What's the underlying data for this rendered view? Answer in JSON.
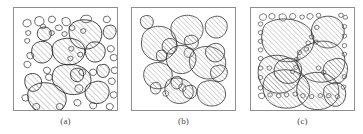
{
  "figure": {
    "panel_count": 3,
    "background_color": "#ffffff",
    "frame_color": "#8e8e8e",
    "grain_outline_color": "#2b2b2b",
    "hatch_color": "#7a7a7a",
    "label_color": "#4a4a4a"
  },
  "panels": [
    {
      "id": "panel-a",
      "label": "(a)",
      "description": "Many small voids and few scattered medium hatched grains in a matrix",
      "frame": {
        "x": 13,
        "y": 7,
        "width": 105,
        "height": 104
      },
      "hatched_grain_count": 12,
      "void_count": 46
    },
    {
      "id": "panel-b",
      "label": "(b)",
      "description": "Uniform medium-to-large hatched grains with moderate spacing",
      "frame": {
        "x": 131,
        "y": 7,
        "width": 105,
        "height": 104
      },
      "hatched_grain_count": 17,
      "void_count": 3
    },
    {
      "id": "panel-c",
      "label": "(c)",
      "description": "Large interlocking hatched grains with small voids along the boundaries",
      "frame": {
        "x": 250,
        "y": 7,
        "width": 105,
        "height": 104
      },
      "hatched_grain_count": 9,
      "void_count": 52
    }
  ],
  "shapes": {
    "panel_a": {
      "grains": [
        "M 62,14 C 70,10 84,12 88,20 C 92,28 88,38 79,41 C 69,44 59,39 57,30 C 55,22 56,17 62,14 Z",
        "M 22,36 C 28,32 37,34 39,41 C 41,48 37,55 30,56 C 23,57 18,51 18,45 C 18,40 19,38 22,36 Z",
        "M 45,33 C 56,28 70,32 72,41 C 74,51 65,59 54,58 C 44,57 38,49 39,41 C 40,36 41,35 45,33 Z",
        "M 79,35 C 86,33 93,37 93,44 C 93,51 88,56 81,55 C 75,54 72,48 73,42 C 74,38 76,36 79,35 Z",
        "M 44,60 C 57,54 75,59 78,70 C 81,81 70,90 57,88 C 45,86 38,77 39,69 C 40,64 41,62 44,60 Z",
        "M 14,68 C 20,65 27,68 28,74 C 29,80 25,85 19,85 C 14,85 11,80 11,75 C 11,71 12,69 14,68 Z",
        "M 20,79 C 33,72 51,79 53,91 C 55,102 43,110 30,107 C 19,105 13,96 14,87 C 15,82 17,81 20,79 Z",
        "M 80,76 C 88,72 97,77 97,85 C 97,94 89,99 81,97 C 74,95 71,88 73,82 C 74,78 77,77 80,76 Z",
        "M 28,20 C 33,18 38,21 38,26 C 38,31 34,34 29,33 C 25,32 23,28 24,24 C 25,21 26,20 28,20 Z",
        "M 96,18 C 101,16 105,20 104,25 C 103,30 99,33 95,31 C 91,29 90,24 92,21 C 93,19 94,18 96,18 Z",
        "M 62,62 C 67,60 71,63 71,68 C 71,73 67,76 63,75 C 58,74 57,69 58,65 C 59,63 60,62 62,62 Z",
        "M 89,58 C 94,56 98,60 97,65 C 96,70 92,72 88,70 C 84,68 84,63 85,60 C 86,58 87,58 89,58 Z"
      ],
      "voids": [
        "M 10,13 q 4,-3 7,0 q 2,4 -2,6 q -5,1 -6,-3 z",
        "M 22,10 q 5,-3 8,1 q 2,5 -3,7 q -5,1 -6,-4 z",
        "M 36,9 q 4,-2 6,1 q 1,4 -3,5 q -4,0 -4,-3 z",
        "M 49,11 q 5,-3 8,1 q 2,4 -2,6 q -5,1 -6,-4 z",
        "M 70,8 q 7,-2 9,2 q 1,4 -5,5 q -6,0 -6,-4 z",
        "M 92,9 q 4,-2 6,1 q 1,4 -3,5 q -4,0 -4,-3 z",
        "M 28,17 q 3,-2 4,1 q 1,3 -2,3 q -3,0 -3,-2 z",
        "M 43,18 q 4,-2 6,1 q 1,4 -3,4 q -4,0 -4,-3 z",
        "M 57,18 q 3,-2 5,1 q 1,3 -2,4 q -4,0 -4,-3 z",
        "M 12,24 q 3,-2 5,0 q 1,3 -2,4 q -3,0 -3,-2 z",
        "M 36,24 q 3,-2 5,0 q 1,3 -2,4 q -3,0 -3,-2 z",
        "M 49,25 q 3,-2 5,0 q 1,3 -2,4 q -3,0 -3,-2 z",
        "M 68,22 q 3,-2 5,0 q 1,3 -2,4 q -3,0 -3,-2 z",
        "M 11,32 q 3,-2 5,0 q 1,3 -2,4 q -3,0 -3,-2 z",
        "M 44,45 q 0,0 0,0 z",
        "M 56,40 q 3,-2 5,0 q 1,3 -2,4 q -3,0 -3,-2 z",
        "M 65,46 q 3,-2 5,0 q 1,3 -2,4 q -3,0 -3,-2 z",
        "M 14,46 q 4,-2 6,1 q 1,4 -3,5 q -4,0 -4,-4 z",
        "M 11,55 q 4,-2 6,1 q 1,4 -3,5 q -4,0 -4,-4 z",
        "M 31,61 q 4,-2 6,1 q 1,4 -3,5 q -4,0 -4,-4 z",
        "M 44,52 q 0,0 0,0 z",
        "M 55,50 q 3,-2 5,0 q 1,3 -2,4 q -3,0 -3,-2 z",
        "M 83,44 q 0,0 0,0 z",
        "M 96,39 q 4,-2 6,1 q 1,4 -3,5 q -4,0 -4,-4 z",
        "M 99,48 q 4,-2 6,1 q 1,4 -3,5 q -4,0 -4,-4 z",
        "M 66,54 q 0,0 0,0 z",
        "M 40,72 q 0,0 0,0 z",
        "M 57,68 q 0,0 0,0 z",
        "M 67,63 q 4,-2 6,1 q 1,4 -3,5 q -4,0 -4,-4 z",
        "M 78,63 q 4,-2 6,1 q 1,4 -3,5 q -4,0 -4,-4 z",
        "M 100,61 q 4,-2 6,1 q 1,4 -3,5 q -4,0 -4,-4 z",
        "M 33,68 q 4,-2 6,1 q 1,4 -3,5 q -4,0 -4,-4 z",
        "M 58,74 q 0,0 0,0 z",
        "M 63,79 q 5,-2 7,1 q 1,5 -3,6 q -5,0 -5,-4 z",
        "M 88,69 q 0,0 0,0 z",
        "M 97,72 q 4,-2 6,1 q 1,4 -3,5 q -4,0 -4,-4 z",
        "M 9,89 q 4,-2 6,1 q 1,4 -3,5 q -4,0 -4,-4 z",
        "M 56,93 q 0,0 0,0 z",
        "M 62,94 q 4,-2 6,1 q 1,4 -3,5 q -4,0 -4,-4 z",
        "M 70,95 q 0,0 0,0 z",
        "M 91,89 q 0,0 0,0 z",
        "M 99,86 q 4,-2 6,1 q 1,4 -3,5 q -4,0 -4,-4 z",
        "M 20,98 q 4,-2 6,1 q 1,4 -3,5 q -4,0 -4,-4 z",
        "M 44,98 q 4,-2 6,1 q 1,4 -3,5 q -4,0 -4,-4 z",
        "M 78,97 q 4,-2 6,1 q 1,4 -3,5 q -4,0 -4,-4 z",
        "M 95,98 q 4,-2 6,1 q 1,4 -3,5 q -4,0 -4,-4 z"
      ]
    },
    "panel_b": {
      "grains": [
        "M 8,27 C 18,18 38,20 43,34 C 48,48 38,62 24,62 C 11,62 2,52 3,40 C 4,32 5,30 8,27 Z",
        "M 45,12 C 56,5 72,9 75,21 C 78,33 68,44 55,43 C 43,42 36,31 38,21 C 39,16 42,14 45,12 Z",
        "M 86,11 C 94,7 104,12 104,21 C 104,31 96,37 88,35 C 80,33 76,24 79,17 C 81,13 83,12 86,11 Z",
        "M 68,48 C 82,41 100,48 102,62 C 104,76 91,86 77,83 C 64,80 57,68 60,57 C 62,51 65,50 68,48 Z",
        "M 41,46 C 52,41 65,46 67,57 C 69,69 59,79 47,77 C 36,75 30,64 33,55 C 35,49 38,48 41,46 Z",
        "M 14,66 C 24,61 37,66 39,76 C 41,87 32,96 21,95 C 10,94 4,84 6,75 C 8,69 11,67 14,66 Z",
        "M 36,84 C 49,79 63,86 64,97 C 65,107 55,114 44,112 C 34,110 29,101 31,92 C 32,87 34,85 36,84 Z",
        "M 76,87 C 88,82 101,89 102,100 C 103,110 93,117 82,115 C 72,113 67,104 69,95 C 70,90 73,88 76,87 Z",
        "M 32,37 C 38,34 44,37 45,43 C 46,50 41,55 35,54 C 29,53 26,47 28,42 C 29,39 30,38 32,37 Z",
        "M 85,43 C 93,39 101,44 101,52 C 101,60 94,65 87,63 C 80,61 77,54 79,48 C 81,45 83,44 85,43 Z",
        "M 43,81 C 47,79 51,82 51,87 C 51,93 47,96 43,95 C 39,94 37,89 38,85 C 39,82 41,81 43,81 Z",
        "M 5,10 C 11,7 17,10 17,16 C 17,22 12,26 7,24 C 3,22 1,17 2,13 C 3,11 4,10 5,10 Z",
        "M 25,50 C 29,48 33,51 33,56 C 33,61 29,64 25,63 C 21,62 20,57 21,53 C 22,51 23,50 25,50 Z",
        "M 56,92 C 62,89 68,92 68,98 C 68,104 63,108 58,106 C 53,105 51,99 52,95 C 53,93 54,92 56,92 Z",
        "M 92,68 C 99,65 105,70 104,77 C 103,84 97,88 91,86 C 85,84 83,77 85,72 C 87,69 89,68 92,68 Z",
        "M 58,33 C 64,30 70,34 70,40 C 70,46 65,50 60,48 C 55,46 53,40 54,36 C 55,34 56,33 58,33 Z",
        "M 18,88 C 22,86 26,89 26,94 C 26,99 22,102 18,101 C 14,100 13,95 14,91 C 15,89 16,88 18,88 Z"
      ],
      "voids": [
        "M 55,48 q 6,-3 9,2 q 2,6 -4,8 q -6,1 -7,-5 z",
        "M 48,90 q 5,-2 7,2 q 1,5 -3,6 q -5,0 -5,-5 z",
        "M 29,98 q 4,-2 6,1 q 1,4 -3,5 q -4,0 -4,-4 z"
      ]
    },
    "panel_c": {
      "grains": [
        "M 14,17 C 30,8 60,13 66,31 C 72,49 54,64 33,62 C 15,60 5,45 7,31 C 8,23 10,19 14,17 Z",
        "M 73,12 C 85,6 100,11 102,24 C 104,38 93,48 80,46 C 68,44 62,33 65,22 C 67,16 70,13 73,12 Z",
        "M 62,42 C 80,33 102,41 103,60 C 104,78 86,89 68,85 C 52,81 44,65 49,53 C 52,46 57,44 62,42 Z",
        "M 10,58 C 26,50 48,57 51,73 C 54,89 38,101 21,98 C 7,95 1,82 3,70 C 5,62 7,60 10,58 Z",
        "M 18,75 C 37,66 60,75 62,92 C 64,109 46,119 28,115 C 13,112 6,98 9,86 C 11,79 14,77 18,75 Z",
        "M 58,77 C 75,70 95,78 96,95 C 97,111 81,120 65,117 C 51,114 45,101 48,89 C 50,82 54,79 58,77 Z",
        "M 88,60 C 98,55 107,61 106,72 C 105,84 96,90 87,87 C 79,84 76,74 79,67 C 81,62 85,61 88,60 Z",
        "M 86,88 C 95,83 104,89 104,99 C 104,110 96,116 88,113 C 80,110 77,100 79,93 C 81,89 83,89 86,88 Z",
        "M 30,60 C 40,55 52,60 53,70 C 54,81 45,89 34,87 C 24,85 19,76 22,68 C 24,63 27,61 30,60 Z"
      ],
      "voids": [
        "M 5,8 q 4,-3 7,0 q 2,4 -2,6 q -5,1 -6,-3 z",
        "M 16,7 q 4,-2 6,1 q 1,4 -3,5 q -4,0 -4,-3 z",
        "M 27,8 q 5,-3 8,1 q 2,4 -2,6 q -5,1 -6,-4 z",
        "M 40,7 q 4,-2 6,1 q 1,4 -3,5 q -4,0 -4,-3 z",
        "M 51,9 q 3,-2 5,0 q 1,3 -2,4 q -3,0 -3,-2 z",
        "M 60,7 q 4,-2 6,1 q 1,4 -3,5 q -4,0 -4,-3 z",
        "M 70,7 q 3,-2 5,0 q 1,3 -2,4 q -3,0 -3,-2 z",
        "M 96,7 q 3,-2 5,0 q 1,3 -2,4 q -3,0 -3,-2 z",
        "M 102,9 q 3,-2 4,1 q 1,3 -2,3 q -3,0 -3,-2 z",
        "M 3,17 q 3,-2 5,0 q 1,3 -2,4 q -3,0 -3,-2 z",
        "M 3,27 q 3,-2 5,0 q 1,3 -2,4 q -3,0 -3,-2 z",
        "M 3,37 q 3,-2 5,0 q 1,3 -2,4 q -3,0 -3,-2 z",
        "M 3,47 q 3,-2 5,0 q 1,3 -2,4 q -3,0 -3,-2 z",
        "M 3,57 q 3,-2 5,0 q 1,3 -2,4 q -3,0 -3,-2 z",
        "M 3,68 q 3,-2 5,0 q 1,3 -2,4 q -3,0 -3,-2 z",
        "M 3,79 q 3,-2 5,0 q 1,3 -2,4 q -3,0 -3,-2 z",
        "M 3,91 q 3,-2 5,0 q 1,3 -2,4 q -3,0 -3,-2 z",
        "M 4,99 q 4,-2 6,1 q 1,4 -3,5 q -4,0 -4,-4 z",
        "M 100,20 q 3,-2 5,0 q 1,3 -2,4 q -3,0 -3,-2 z",
        "M 100,31 q 3,-2 5,0 q 1,3 -2,4 q -3,0 -3,-2 z",
        "M 100,42 q 3,-2 5,0 q 1,3 -2,4 q -3,0 -3,-2 z",
        "M 100,52 q 3,-2 5,0 q 1,3 -2,4 q -3,0 -3,-2 z",
        "M 100,78 q 3,-2 5,0 q 1,3 -2,4 q -3,0 -3,-2 z",
        "M 99,90 q 3,-2 5,0 q 1,3 -2,4 q -3,0 -3,-2 z",
        "M 68,21 q 3,-2 5,0 q 1,3 -2,4 q -3,0 -3,-2 z",
        "M 62,32 q 3,-2 5,0 q 1,3 -2,4 q -3,0 -3,-2 z",
        "M 58,39 q 3,-2 5,0 q 1,3 -2,4 q -3,0 -3,-2 z",
        "M 67,38 q 3,-2 5,0 q 1,3 -2,4 q -3,0 -3,-2 z",
        "M 56,46 q 3,-2 5,0 q 1,3 -2,4 q -3,0 -3,-2 z",
        "M 48,50 q 3,-2 5,0 q 1,3 -2,4 q -3,0 -3,-2 z",
        "M 45,58 q 3,-2 5,0 q 1,3 -2,4 q -3,0 -3,-2 z",
        "M 44,67 q 3,-2 5,0 q 1,3 -2,4 q -3,0 -3,-2 z",
        "M 13,68 q 3,-2 5,0 q 1,3 -2,4 q -3,0 -3,-2 z",
        "M 40,72 q 3,-2 5,0 q 1,3 -2,4 q -3,0 -3,-2 z",
        "M 70,68 q 3,-2 5,0 q 1,3 -2,4 q -3,0 -3,-2 z",
        "M 76,73 q 3,-2 5,0 q 1,3 -2,4 q -3,0 -3,-2 z",
        "M 43,98 q 3,-2 5,0 q 1,3 -2,4 q -3,0 -3,-2 z",
        "M 52,100 q 3,-2 5,0 q 1,3 -2,4 q -3,0 -3,-2 z",
        "M 62,101 q 3,-2 5,0 q 1,3 -2,4 q -3,0 -3,-2 z",
        "M 72,100 q 3,-2 5,0 q 1,3 -2,4 q -3,0 -3,-2 z",
        "M 82,100 q 3,-2 5,0 q 1,3 -2,4 q -3,0 -3,-2 z",
        "M 92,101 q 3,-2 5,0 q 1,3 -2,4 q -3,0 -3,-2 z",
        "M 14,99 q 3,-2 5,0 q 1,3 -2,4 q -3,0 -3,-2 z",
        "M 24,100 q 3,-2 5,0 q 1,3 -2,4 q -3,0 -3,-2 z",
        "M 33,99 q 3,-2 5,0 q 1,3 -2,4 q -3,0 -3,-2 z",
        "M 88,16 q 0,0 0,0 z",
        "M 74,54 q 0,0 0,0 z",
        "M 36,23 q 0,0 0,0 z",
        "M 20,40 q 0,0 0,0 z",
        "M 50,85 q 0,0 0,0 z",
        "M 30,90 q 0,0 0,0 z",
        "M 90,45 q 0,0 0,0 z"
      ]
    }
  }
}
